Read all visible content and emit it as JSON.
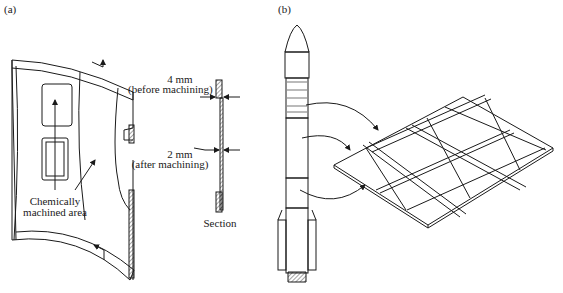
{
  "panels": {
    "a": {
      "label": "(a)",
      "thickness_before": "4 mm",
      "thickness_before_note": "(before machining)",
      "thickness_after": "2 mm",
      "thickness_after_note": "(after machining)",
      "callout_line1": "Chemically",
      "callout_line2": "machined area",
      "section_label": "Section"
    },
    "b": {
      "label": "(b)"
    }
  },
  "colors": {
    "ink": "#1a1a1a",
    "background": "#ffffff"
  }
}
